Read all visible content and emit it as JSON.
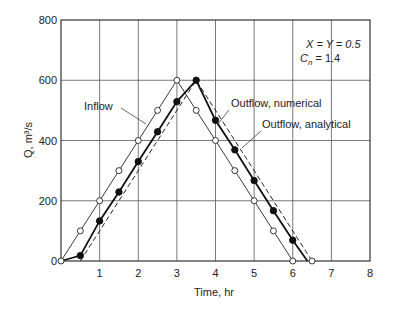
{
  "chart_data": {
    "type": "line",
    "title": "",
    "xlabel": "Time, hr",
    "ylabel": "Q, m³/s",
    "xlim": [
      0,
      8
    ],
    "ylim": [
      0,
      800
    ],
    "xticks": [
      1,
      2,
      3,
      4,
      5,
      6,
      7,
      8
    ],
    "yticks": [
      0,
      200,
      400,
      600,
      800
    ],
    "grid": true,
    "legend": "none (inline annotations)",
    "annotations": [
      {
        "text": "Inflow",
        "target": "Inflow"
      },
      {
        "text": "Outflow, numerical",
        "target": "Outflow, numerical"
      },
      {
        "text": "Outflow, analytical",
        "target": "Outflow, analytical"
      }
    ],
    "parameters": {
      "line1": "X = Y = 0.5",
      "line2_symbol": "C",
      "line2_sub": "n",
      "line2_rest": " = 1.4"
    },
    "series": [
      {
        "name": "Inflow",
        "style": "thin solid, open circles",
        "x": [
          0,
          0.5,
          1.0,
          1.5,
          2.0,
          2.5,
          3.0,
          3.5,
          4.0,
          4.5,
          5.0,
          5.5,
          6.0
        ],
        "values": [
          0,
          100,
          200,
          300,
          400,
          500,
          600,
          500,
          400,
          300,
          200,
          100,
          0
        ]
      },
      {
        "name": "Outflow, numerical",
        "style": "thick solid, filled circles",
        "x": [
          0,
          0.5,
          1.0,
          1.5,
          2.0,
          2.5,
          3.0,
          3.5,
          4.0,
          4.5,
          5.0,
          5.5,
          6.0,
          6.38
        ],
        "values": [
          0,
          18,
          133,
          229,
          330,
          429,
          529,
          600,
          467,
          369,
          267,
          167,
          69,
          0
        ]
      },
      {
        "name": "Outflow, analytical",
        "style": "dashed, open circle at end",
        "x": [
          0.5,
          3.5,
          6.5
        ],
        "values": [
          0,
          600,
          0
        ]
      }
    ]
  }
}
